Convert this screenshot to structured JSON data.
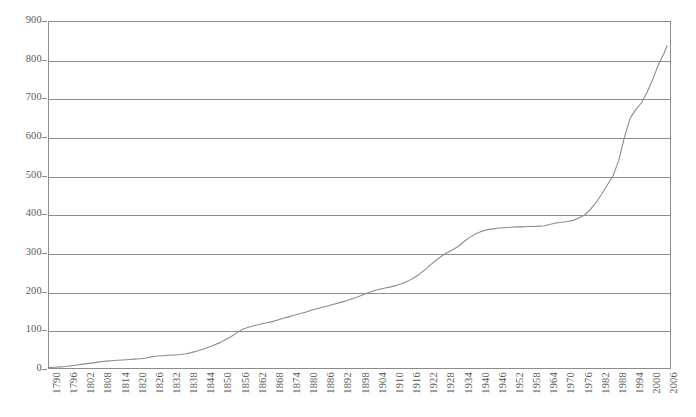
{
  "chart_data": {
    "type": "line",
    "title": "",
    "subtitle": "",
    "xlabel": "",
    "ylabel": "",
    "xlim": [
      1790,
      2008
    ],
    "ylim": [
      0,
      900
    ],
    "ytick_labels": [
      "900",
      "800",
      "700",
      "600",
      "500",
      "400",
      "300",
      "200",
      "100",
      "0"
    ],
    "ytick_values": [
      900,
      800,
      700,
      600,
      500,
      400,
      300,
      200,
      100,
      0
    ],
    "xtick_labels": [
      "1790",
      "1796",
      "1802",
      "1808",
      "1814",
      "1820",
      "1826",
      "1832",
      "1838",
      "1844",
      "1850",
      "1856",
      "1862",
      "1868",
      "1874",
      "1880",
      "1886",
      "1892",
      "1898",
      "1904",
      "1910",
      "1916",
      "1922",
      "1928",
      "1934",
      "1940",
      "1946",
      "1952",
      "1958",
      "1964",
      "1970",
      "1976",
      "1982",
      "1988",
      "1994",
      "2000",
      "2006"
    ],
    "xtick_values": [
      1790,
      1796,
      1802,
      1808,
      1814,
      1820,
      1826,
      1832,
      1838,
      1844,
      1850,
      1856,
      1862,
      1868,
      1874,
      1880,
      1886,
      1892,
      1898,
      1904,
      1910,
      1916,
      1922,
      1928,
      1934,
      1940,
      1946,
      1952,
      1958,
      1964,
      1970,
      1976,
      1982,
      1988,
      1994,
      2000,
      2006
    ],
    "grid": true,
    "legend": false,
    "line_color": "#8c8c8c",
    "axis_color": "#8c8c8c",
    "label_color": "#5a5a5a",
    "background": "#ffffff",
    "series": [
      {
        "name": "series-1",
        "x": [
          1790,
          1792,
          1794,
          1796,
          1798,
          1800,
          1802,
          1804,
          1806,
          1808,
          1810,
          1812,
          1814,
          1816,
          1818,
          1820,
          1822,
          1824,
          1826,
          1828,
          1830,
          1832,
          1834,
          1836,
          1838,
          1840,
          1842,
          1844,
          1846,
          1848,
          1850,
          1852,
          1854,
          1856,
          1858,
          1860,
          1862,
          1864,
          1866,
          1868,
          1870,
          1872,
          1874,
          1876,
          1878,
          1880,
          1882,
          1884,
          1886,
          1888,
          1890,
          1892,
          1894,
          1896,
          1898,
          1900,
          1902,
          1904,
          1906,
          1908,
          1910,
          1912,
          1914,
          1916,
          1918,
          1920,
          1922,
          1924,
          1926,
          1928,
          1930,
          1932,
          1934,
          1936,
          1938,
          1940,
          1942,
          1944,
          1946,
          1948,
          1950,
          1952,
          1954,
          1956,
          1958,
          1960,
          1962,
          1964,
          1966,
          1968,
          1970,
          1972,
          1974,
          1976,
          1978,
          1980,
          1982,
          1984,
          1986,
          1988,
          1990,
          1992,
          1994,
          1996,
          1998,
          2000,
          2002,
          2004,
          2006,
          2007
        ],
        "y": [
          1,
          2,
          3,
          4,
          6,
          8,
          10,
          12,
          14,
          16,
          18,
          19,
          20,
          21,
          22,
          23,
          24,
          26,
          29,
          31,
          32,
          33,
          34,
          35,
          37,
          40,
          44,
          49,
          54,
          60,
          66,
          74,
          82,
          92,
          101,
          106,
          110,
          114,
          117,
          120,
          124,
          129,
          133,
          137,
          141,
          145,
          150,
          154,
          158,
          162,
          166,
          170,
          174,
          179,
          184,
          190,
          196,
          201,
          205,
          208,
          211,
          215,
          220,
          226,
          234,
          244,
          256,
          269,
          281,
          292,
          301,
          309,
          318,
          331,
          341,
          350,
          356,
          360,
          362,
          364,
          365,
          366,
          367,
          367,
          368,
          368,
          369,
          370,
          374,
          377,
          379,
          381,
          384,
          390,
          398,
          412,
          430,
          452,
          476,
          500,
          540,
          600,
          650,
          672,
          690,
          718,
          752,
          790,
          820,
          838
        ]
      }
    ]
  },
  "axis": {
    "y_labels": [
      "900",
      "800",
      "700",
      "600",
      "500",
      "400",
      "300",
      "200",
      "100",
      "0"
    ],
    "x_labels": [
      "1790",
      "1796",
      "1802",
      "1808",
      "1814",
      "1820",
      "1826",
      "1832",
      "1838",
      "1844",
      "1850",
      "1856",
      "1862",
      "1868",
      "1874",
      "1880",
      "1886",
      "1892",
      "1898",
      "1904",
      "1910",
      "1916",
      "1922",
      "1928",
      "1934",
      "1940",
      "1946",
      "1952",
      "1958",
      "1964",
      "1970",
      "1976",
      "1982",
      "1988",
      "1994",
      "2000",
      "2006"
    ]
  }
}
